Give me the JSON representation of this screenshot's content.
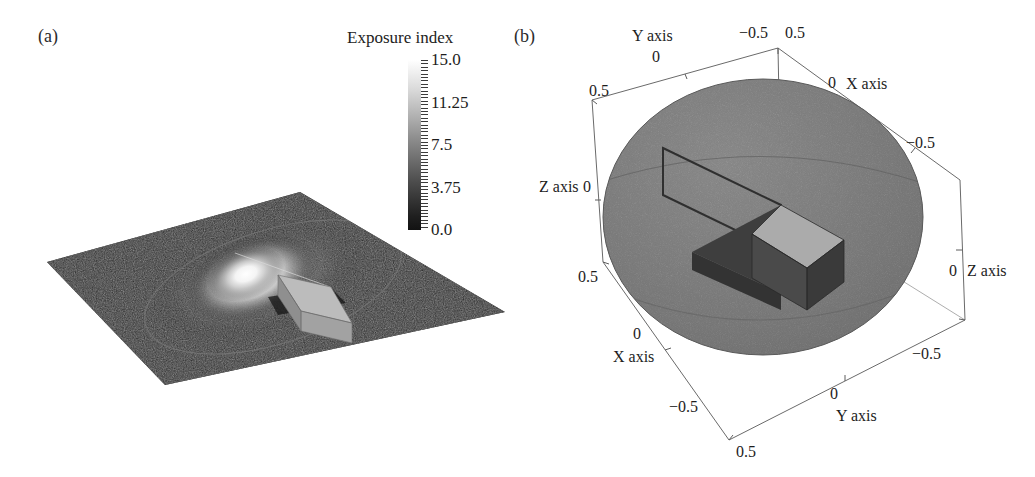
{
  "figure": {
    "panels": [
      {
        "id": "a",
        "label": "(a)"
      },
      {
        "id": "b",
        "label": "(b)"
      }
    ]
  },
  "colorbar": {
    "title": "Exposure index",
    "orientation": "vertical",
    "high_color": "#ffffff",
    "low_color": "#101010",
    "ticks": [
      {
        "label": "15.0",
        "value": 15.0,
        "pos": 0.0
      },
      {
        "label": "11.25",
        "value": 11.25,
        "pos": 0.25
      },
      {
        "label": "7.5",
        "value": 7.5,
        "pos": 0.5
      },
      {
        "label": "3.75",
        "value": 3.75,
        "pos": 0.75
      },
      {
        "label": "0.0",
        "value": 0.0,
        "pos": 1.0
      }
    ]
  },
  "panel_a": {
    "description": "planar exposure-index map with bright hotspot and rectangular block",
    "plane_color": "#1b1b1b",
    "hotspot_color": "#ffffff",
    "block_top_color": "#b9b9b9",
    "block_side_color": "#8c8c8c",
    "ellipse_outline_color": "#6e6e6e"
  },
  "panel_b": {
    "description": "3D bounding box containing a grey sphere with a slotted slab insert",
    "sphere_color": "#7d7d7d",
    "slab_dark_color": "#3e3e3e",
    "slab_light_color": "#a9a9a9",
    "box_line_color": "#5a5a5a",
    "axes": [
      {
        "name": "Y axis",
        "placement": "top-left",
        "name_x": 632,
        "name_y": 27,
        "ticks": [
          {
            "label": "0",
            "x": 652,
            "y": 48
          },
          {
            "label": "0.5",
            "x": 589,
            "y": 82
          },
          {
            "label": "-0.5",
            "x": 739,
            "y": 24
          }
        ]
      },
      {
        "name": "X axis",
        "placement": "top-right",
        "name_x": 846,
        "name_y": 75,
        "ticks": [
          {
            "label": "0",
            "x": 828,
            "y": 74
          },
          {
            "label": "0.5",
            "x": 785,
            "y": 24
          },
          {
            "label": "-0.5",
            "x": 906,
            "y": 134
          }
        ]
      },
      {
        "name": "Z axis",
        "placement": "left",
        "name_x": 539,
        "name_y": 178,
        "ticks": [
          {
            "label": "0",
            "x": 583,
            "y": 178
          }
        ]
      },
      {
        "name": "Z axis",
        "placement": "right",
        "name_x": 967,
        "name_y": 262,
        "ticks": [
          {
            "label": "0",
            "x": 949,
            "y": 262
          },
          {
            "label": "-0.5",
            "x": 912,
            "y": 345
          }
        ]
      },
      {
        "name": "X axis",
        "placement": "bottom-left",
        "name_x": 613,
        "name_y": 348,
        "ticks": [
          {
            "label": "0",
            "x": 633,
            "y": 325
          },
          {
            "label": "0.5",
            "x": 578,
            "y": 268
          },
          {
            "label": "-0.5",
            "x": 669,
            "y": 398
          }
        ]
      },
      {
        "name": "Y axis",
        "placement": "bottom-right",
        "name_x": 836,
        "name_y": 407,
        "ticks": [
          {
            "label": "0",
            "x": 830,
            "y": 385
          },
          {
            "label": "0.5",
            "x": 736,
            "y": 443
          }
        ]
      }
    ]
  },
  "chart_data": {
    "type": "scatter",
    "subplots": [
      {
        "panel": "a",
        "type": "heatmap",
        "title": "",
        "colorbar_label": "Exposure index",
        "value_range": [
          0.0,
          15.0
        ],
        "colormap": "grayscale",
        "features": [
          {
            "name": "background-plane",
            "value": 0.3
          },
          {
            "name": "elliptical-boundary",
            "value": 1.5
          },
          {
            "name": "central-hotspot-peak",
            "value": 15.0
          },
          {
            "name": "block-shadow",
            "value": 0.5
          }
        ]
      },
      {
        "panel": "b",
        "type": "scatter",
        "title": "",
        "xlabel": "X axis",
        "ylabel": "Y axis",
        "zlabel": "Z axis",
        "xlim": [
          -0.5,
          0.5
        ],
        "ylim": [
          -0.5,
          0.5
        ],
        "zlim": [
          -0.5,
          0.5
        ],
        "xticks": [
          -0.5,
          0,
          0.5
        ],
        "yticks": [
          -0.5,
          0,
          0.5
        ],
        "zticks": [
          -0.5,
          0,
          0.5
        ],
        "grid": false,
        "legend": "none",
        "objects": [
          {
            "name": "sphere",
            "radius": 0.42,
            "center": [
              0,
              0,
              0
            ]
          },
          {
            "name": "slab",
            "orientation": "radial",
            "protrudes": true
          }
        ]
      }
    ]
  }
}
